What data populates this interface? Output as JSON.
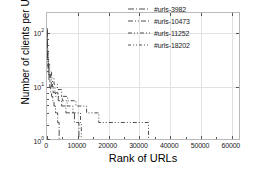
{
  "chart_data": {
    "type": "line",
    "title": "",
    "xlabel": "Rank of URLs",
    "ylabel": "Number of clients per URL",
    "xlim": [
      0,
      63000
    ],
    "ylim": [
      1,
      200
    ],
    "yscale": "log",
    "xscale": "linear",
    "grid": true,
    "legend_position": "top-right",
    "xticks": [
      0,
      10000,
      20000,
      30000,
      40000,
      50000,
      60000
    ],
    "xtick_labels": [
      "0",
      "10000",
      "20000",
      "30000",
      "40000",
      "50000",
      "60000"
    ],
    "yticks": [
      1,
      10,
      100
    ],
    "ytick_labels": [
      "10⁰",
      "10¹",
      "10²"
    ],
    "series": [
      {
        "name": "#urls-3982",
        "linestyle": "dash-dot",
        "color": "#3a3a3a",
        "n_urls": 3982,
        "points": [
          [
            10,
            90
          ],
          [
            40,
            60
          ],
          [
            80,
            42
          ],
          [
            150,
            30
          ],
          [
            260,
            22
          ],
          [
            420,
            16
          ],
          [
            650,
            12
          ],
          [
            900,
            9
          ],
          [
            1200,
            7
          ],
          [
            1500,
            6
          ],
          [
            1900,
            5
          ],
          [
            2300,
            4
          ],
          [
            2800,
            3
          ],
          [
            3200,
            3
          ],
          [
            3500,
            2
          ],
          [
            3900,
            2
          ],
          [
            3982,
            1
          ]
        ]
      },
      {
        "name": "#urls-10473",
        "linestyle": "dash-dot",
        "color": "#3a3a3a",
        "n_urls": 10473,
        "points": [
          [
            10,
            95
          ],
          [
            45,
            62
          ],
          [
            100,
            40
          ],
          [
            200,
            28
          ],
          [
            350,
            20
          ],
          [
            600,
            15
          ],
          [
            950,
            11
          ],
          [
            1400,
            9
          ],
          [
            2000,
            7
          ],
          [
            2800,
            6
          ],
          [
            3700,
            5
          ],
          [
            4800,
            4
          ],
          [
            6200,
            3
          ],
          [
            7800,
            3
          ],
          [
            9000,
            2
          ],
          [
            10200,
            2
          ],
          [
            10473,
            1
          ]
        ]
      },
      {
        "name": "#urls-11252",
        "linestyle": "dash-dot-dot",
        "color": "#3a3a3a",
        "n_urls": 11252,
        "points": [
          [
            10,
            100
          ],
          [
            50,
            65
          ],
          [
            120,
            42
          ],
          [
            250,
            29
          ],
          [
            450,
            21
          ],
          [
            750,
            16
          ],
          [
            1200,
            12
          ],
          [
            1800,
            9
          ],
          [
            2600,
            7
          ],
          [
            3600,
            6
          ],
          [
            5000,
            5
          ],
          [
            6600,
            4
          ],
          [
            8500,
            3
          ],
          [
            10000,
            3
          ],
          [
            11000,
            2
          ],
          [
            11252,
            1
          ]
        ]
      },
      {
        "name": "#urls-18202",
        "linestyle": "dash-dot-dot",
        "color": "#3a3a3a",
        "n_urls": 18202,
        "points": [
          [
            10,
            105
          ],
          [
            60,
            68
          ],
          [
            140,
            45
          ],
          [
            300,
            31
          ],
          [
            550,
            23
          ],
          [
            900,
            17
          ],
          [
            1500,
            13
          ],
          [
            2300,
            10
          ],
          [
            3400,
            8
          ],
          [
            4800,
            6
          ],
          [
            6800,
            5
          ],
          [
            9500,
            4
          ],
          [
            13000,
            3
          ],
          [
            16500,
            3
          ],
          [
            17000,
            2
          ],
          [
            26500,
            2
          ],
          [
            27000,
            2
          ],
          [
            30500,
            2
          ],
          [
            33200,
            2
          ],
          [
            33300,
            1
          ]
        ]
      }
    ]
  },
  "legend": {
    "entries": [
      {
        "label": "#urls-3982"
      },
      {
        "label": "#urls-10473"
      },
      {
        "label": "#urls-11252"
      },
      {
        "label": "#urls-18202"
      }
    ]
  }
}
